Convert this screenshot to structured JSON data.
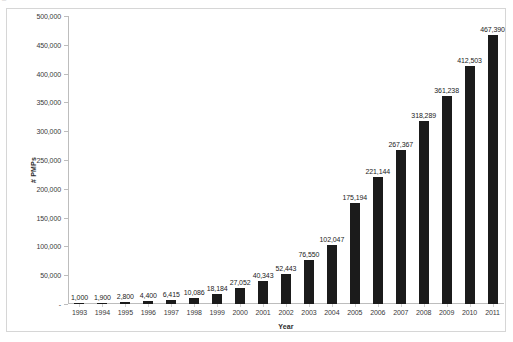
{
  "scan_fragment": "ــ  ▪ ▪",
  "chart_data": {
    "type": "bar",
    "title": "",
    "xlabel": "Year",
    "ylabel": "# PMPs",
    "categories": [
      "1993",
      "1994",
      "1995",
      "1996",
      "1997",
      "1998",
      "1999",
      "2000",
      "2001",
      "2002",
      "2003",
      "2004",
      "2005",
      "2006",
      "2007",
      "2008",
      "2009",
      "2010",
      "2011"
    ],
    "values": [
      1000,
      1900,
      2800,
      4400,
      6415,
      10086,
      18184,
      27052,
      40343,
      52443,
      76550,
      102047,
      175194,
      221144,
      267367,
      318289,
      361238,
      412503,
      467390
    ],
    "value_labels": [
      "1,000",
      "1,900",
      "2,800",
      "4,400",
      "6,415",
      "10,086",
      "18,184",
      "27,052",
      "40,343",
      "52,443",
      "76,550",
      "102,047",
      "175,194",
      "221,144",
      "267,367",
      "318,289",
      "361,238",
      "412,503",
      "467,390"
    ],
    "ylim": [
      0,
      500000
    ],
    "ytick_values": [
      0,
      50000,
      100000,
      150000,
      200000,
      250000,
      300000,
      350000,
      400000,
      450000,
      500000
    ],
    "ytick_labels": [
      "-",
      "50,000",
      "100,000",
      "150,000",
      "200,000",
      "250,000",
      "300,000",
      "350,000",
      "400,000",
      "450,000",
      "500,000"
    ],
    "grid": false,
    "legend": false,
    "bar_color": "#1b1b1b",
    "axis_color": "#bdbdbd",
    "data_labels": true,
    "series": [
      {
        "name": "# PMPs",
        "values": [
          1000,
          1900,
          2800,
          4400,
          6415,
          10086,
          18184,
          27052,
          40343,
          52443,
          76550,
          102047,
          175194,
          221144,
          267367,
          318289,
          361238,
          412503,
          467390
        ]
      }
    ]
  }
}
